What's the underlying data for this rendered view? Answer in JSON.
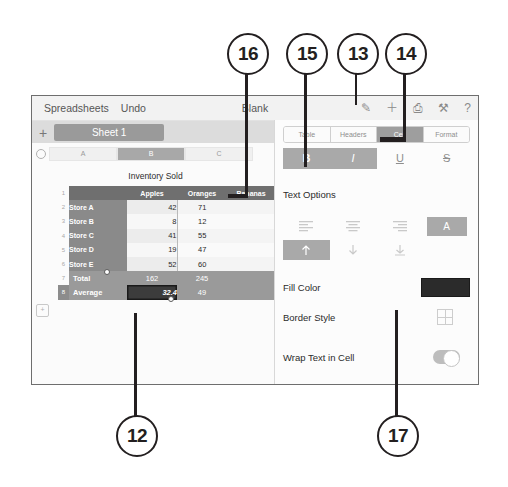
{
  "figure": {
    "callouts": [
      {
        "id": "c16",
        "label": "16"
      },
      {
        "id": "c15",
        "label": "15"
      },
      {
        "id": "c13",
        "label": "13"
      },
      {
        "id": "c14",
        "label": "14"
      },
      {
        "id": "c12",
        "label": "12"
      },
      {
        "id": "c17",
        "label": "17"
      }
    ]
  },
  "topbar": {
    "app_label": "Spreadsheets",
    "undo_label": "Undo",
    "document_name": "Blank",
    "icons": [
      {
        "name": "format-brush-icon",
        "glyph": "✎"
      },
      {
        "name": "insert-plus-icon",
        "glyph": "＋"
      },
      {
        "name": "share-document-icon",
        "glyph": "⎙"
      },
      {
        "name": "tools-wrench-icon",
        "glyph": "⚒"
      },
      {
        "name": "help-question-icon",
        "glyph": "?"
      }
    ]
  },
  "sheetbar": {
    "add_sheet_label": "+",
    "sheet_tab_label": "Sheet 1"
  },
  "spreadsheet": {
    "column_headers": [
      "A",
      "B",
      "C"
    ],
    "selected_column": "B",
    "row_numbers": [
      "1",
      "2",
      "3",
      "4",
      "5",
      "6",
      "7",
      "8"
    ],
    "selected_row": "8",
    "table_title": "Inventory Sold",
    "header_row": [
      "",
      "Apples",
      "Oranges",
      "Bananas"
    ],
    "rows": [
      {
        "label": "Store A",
        "apples": "42",
        "oranges": "71"
      },
      {
        "label": "Store B",
        "apples": "8",
        "oranges": "12"
      },
      {
        "label": "Store C",
        "apples": "41",
        "oranges": "55"
      },
      {
        "label": "Store D",
        "apples": "19",
        "oranges": "47"
      },
      {
        "label": "Store E",
        "apples": "52",
        "oranges": "60"
      }
    ],
    "total_row": {
      "label": "Total",
      "apples": "162",
      "oranges": "245"
    },
    "average_row": {
      "label": "Average",
      "apples": "32.4",
      "oranges": "49"
    },
    "add_row_label": "+"
  },
  "inspector": {
    "tabs": [
      {
        "label": "Table",
        "selected": false
      },
      {
        "label": "Headers",
        "selected": false
      },
      {
        "label": "Cell",
        "selected": true
      },
      {
        "label": "Format",
        "selected": false
      }
    ],
    "style_buttons": [
      {
        "name": "bold",
        "glyph": "B",
        "active": true
      },
      {
        "name": "italic",
        "glyph": "I",
        "active": true
      },
      {
        "name": "underline",
        "glyph": "U",
        "active": false
      },
      {
        "name": "strikethrough",
        "glyph": "S",
        "active": false
      }
    ],
    "text_options_label": "Text Options",
    "fill_color_label": "Fill Color",
    "fill_color_value": "#2b2b2b",
    "border_style_label": "Border Style",
    "wrap_text_label": "Wrap Text in Cell",
    "wrap_text_on": true
  }
}
